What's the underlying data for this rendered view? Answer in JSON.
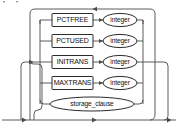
{
  "diagram": {
    "kind": "railroad-syntax-diagram",
    "branches": [
      {
        "id": "pctfree",
        "keyword": "PCTFREE",
        "keyword_shape": "rectangle",
        "argument": "integer",
        "argument_shape": "oval",
        "row_y": 20
      },
      {
        "id": "pctused",
        "keyword": "PCTUSED",
        "keyword_shape": "rectangle",
        "argument": "integer",
        "argument_shape": "oval",
        "row_y": 41
      },
      {
        "id": "initrans",
        "keyword": "INITRANS",
        "keyword_shape": "rectangle",
        "argument": "integer",
        "argument_shape": "oval",
        "row_y": 62
      },
      {
        "id": "maxtrans",
        "keyword": "MAXTRANS",
        "keyword_shape": "rectangle",
        "argument": "integer",
        "argument_shape": "oval",
        "row_y": 83
      },
      {
        "id": "storage-clause",
        "keyword": "storage_clause",
        "keyword_shape": "oval",
        "argument": null,
        "argument_shape": null,
        "row_y": 104
      }
    ],
    "colors": {
      "background": "#ffffff",
      "rail": "#4a4a4a",
      "shape_stroke": "#2b2b2b",
      "shape_fill": "#ffffff",
      "text": "#101010"
    },
    "flow": {
      "entry_direction": "right",
      "loop_back_direction": "left",
      "entry_arrow": "arrow-right",
      "loop_arrow": "arrow-left",
      "exit_arrow": "arrow-right"
    }
  }
}
